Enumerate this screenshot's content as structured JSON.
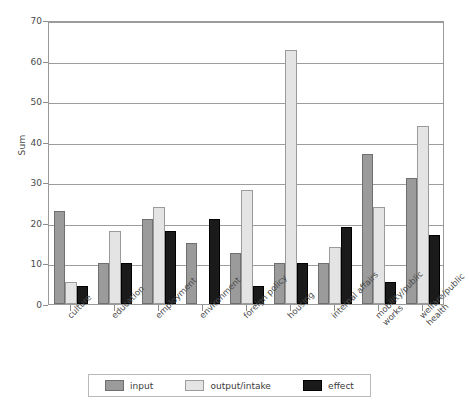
{
  "chart_data": {
    "type": "bar",
    "title": "",
    "subtitle": "",
    "xlabel": "",
    "ylabel": "Sum",
    "ylim": [
      0,
      70
    ],
    "yticks": [
      0,
      10,
      20,
      30,
      40,
      50,
      60,
      70
    ],
    "grid": true,
    "legend_position": "bottom",
    "categories": [
      "culture",
      "education",
      "employment",
      "environment",
      "foreign policy",
      "housing",
      "internal affairs",
      "mobility/public works",
      "welfare/public health"
    ],
    "category_lines": [
      [
        "culture",
        ""
      ],
      [
        "education",
        ""
      ],
      [
        "employment",
        ""
      ],
      [
        "environment",
        ""
      ],
      [
        "foreign policy",
        ""
      ],
      [
        "housing",
        ""
      ],
      [
        "internal affairs",
        ""
      ],
      [
        "mobility/public",
        "works"
      ],
      [
        "welfare/public",
        "health"
      ]
    ],
    "series": [
      {
        "name": "input",
        "color": "#9b9b9b",
        "values": [
          23,
          10,
          21,
          15,
          12.5,
          10,
          10,
          37,
          31
        ]
      },
      {
        "name": "output/intake",
        "color": "#e4e4e4",
        "values": [
          5.5,
          18,
          24,
          0,
          28,
          62.5,
          14,
          24,
          44
        ]
      },
      {
        "name": "effect",
        "color": "#1a1a1a",
        "values": [
          4.5,
          10,
          18,
          21,
          4.5,
          10,
          19,
          5.5,
          17
        ]
      }
    ]
  },
  "legend": {
    "items": [
      {
        "label": "input",
        "series": "input"
      },
      {
        "label": "output/intake",
        "series": "output"
      },
      {
        "label": "effect",
        "series": "effect"
      }
    ]
  }
}
